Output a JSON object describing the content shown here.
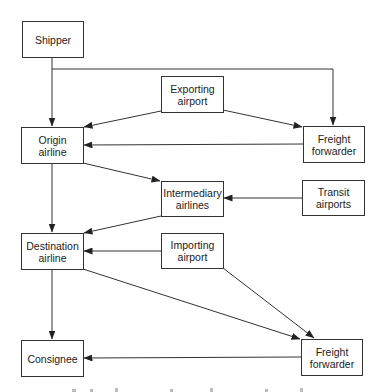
{
  "nodes": {
    "shipper": {
      "label": "Shipper"
    },
    "exporting_airport": {
      "label": "Exporting\nairport"
    },
    "origin_airline": {
      "label": "Origin\nairline"
    },
    "freight_forwarder_top": {
      "label": "Freight\nforwarder"
    },
    "intermediary_airlines": {
      "label": "Intermediary\nairlines"
    },
    "transit_airports": {
      "label": "Transit\nairports"
    },
    "destination_airline": {
      "label": "Destination\nairline"
    },
    "importing_airport": {
      "label": "Importing\nairport"
    },
    "consignee": {
      "label": "Consignee"
    },
    "freight_forwarder_bottom": {
      "label": "Freight\nforwarder"
    }
  },
  "edges": [
    {
      "from": "Shipper",
      "to": "Origin airline"
    },
    {
      "from": "Shipper",
      "to": "Freight forwarder (top)"
    },
    {
      "from": "Exporting airport",
      "to": "Origin airline"
    },
    {
      "from": "Exporting airport",
      "to": "Freight forwarder (top)"
    },
    {
      "from": "Freight forwarder (top)",
      "to": "Origin airline"
    },
    {
      "from": "Origin airline",
      "to": "Intermediary airlines"
    },
    {
      "from": "Origin airline",
      "to": "Destination airline"
    },
    {
      "from": "Transit airports",
      "to": "Intermediary airlines"
    },
    {
      "from": "Intermediary airlines",
      "to": "Destination airline"
    },
    {
      "from": "Importing airport",
      "to": "Destination airline"
    },
    {
      "from": "Importing airport",
      "to": "Freight forwarder (bottom)"
    },
    {
      "from": "Destination airline",
      "to": "Freight forwarder (bottom)"
    },
    {
      "from": "Destination airline",
      "to": "Consignee"
    },
    {
      "from": "Freight forwarder (bottom)",
      "to": "Consignee"
    }
  ],
  "colors": {
    "line": "#333333",
    "box_border": "#333333",
    "text": "#222222"
  }
}
